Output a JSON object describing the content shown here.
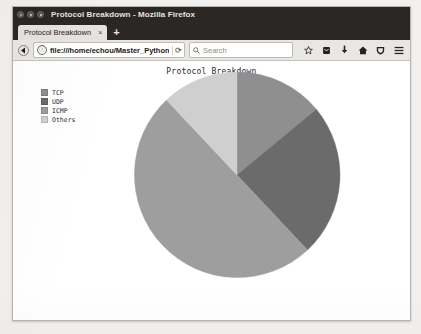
{
  "window": {
    "title": "Protocol Breakdown - Mozilla Firefox",
    "controls": [
      "close",
      "minimize",
      "maximize"
    ]
  },
  "tabs": [
    {
      "label": "Protocol Breakdown",
      "close_label": "×",
      "active": true
    }
  ],
  "newtab_label": "+",
  "navbar": {
    "back_icon": "back-arrow-icon",
    "identity_icon": "ⓘ",
    "url": "file:///home/echou/Master_Python_Networking/Chap",
    "url_placeholder": "Search or enter address",
    "reload_label": "⟳",
    "search_placeholder": "Search",
    "icons": [
      "bookmark-star-icon",
      "pocket-icon",
      "downloads-icon",
      "home-icon",
      "shield-icon",
      "menu-icon"
    ]
  },
  "chart_data": {
    "type": "pie",
    "title": "Protocol Breakdown",
    "xlabel": "",
    "ylabel": "",
    "legend_position": "upper-left",
    "grid": false,
    "startangle": 90,
    "direction": "clockwise",
    "categories": [
      "TCP",
      "UDP",
      "ICMP",
      "Others"
    ],
    "values": [
      14,
      24,
      50,
      12
    ],
    "colors": [
      "#8f8f8f",
      "#6b6b6b",
      "#9e9e9e",
      "#cfcfcf"
    ],
    "slices": [
      {
        "label": "TCP",
        "value": 14,
        "percent": 14,
        "color": "#8f8f8f"
      },
      {
        "label": "UDP",
        "value": 24,
        "percent": 24,
        "color": "#6b6b6b"
      },
      {
        "label": "ICMP",
        "value": 50,
        "percent": 50,
        "color": "#9e9e9e"
      },
      {
        "label": "Others",
        "value": 12,
        "percent": 12,
        "color": "#cfcfcf"
      }
    ]
  },
  "theme": {
    "titlebar_bg": "#2b2724",
    "toolbar_bg": "#e9e7e4",
    "page_bg": "#ffffff",
    "text": "#2a2a2a"
  }
}
